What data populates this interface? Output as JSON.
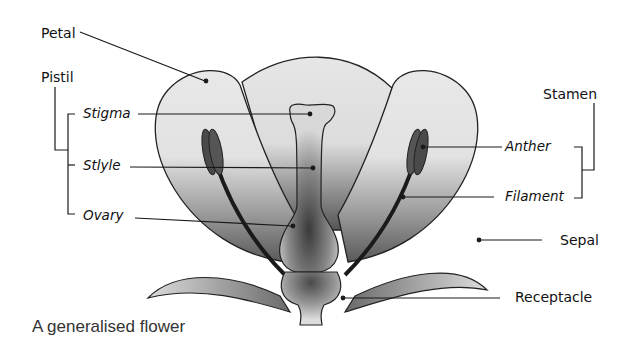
{
  "diagram": {
    "title": "A generalised flower",
    "colors": {
      "outline": "#222222",
      "petal_light": "#e6e6e6",
      "petal_dark": "#6a6a6a",
      "anther": "#4a4a4a",
      "filament": "#1a1a1a",
      "leader_line": "#1a1a1a"
    },
    "labels": {
      "petal": "Petal",
      "pistil": "Pistil",
      "stigma": "Stigma",
      "style": "Stlyle",
      "ovary": "Ovary",
      "stamen": "Stamen",
      "anther": "Anther",
      "filament": "Filament",
      "sepal": "Sepal",
      "receptacle": "Receptacle"
    },
    "groups": [
      {
        "name": "Pistil",
        "members": [
          "Stigma",
          "Stlyle",
          "Ovary"
        ]
      },
      {
        "name": "Stamen",
        "members": [
          "Anther",
          "Filament"
        ]
      }
    ]
  }
}
